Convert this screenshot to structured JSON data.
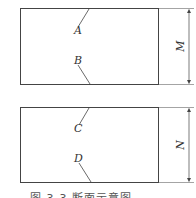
{
  "diagram": {
    "upper_block": {
      "label_top": "A",
      "label_bottom": "B",
      "dimension_label": "M"
    },
    "lower_block": {
      "label_top": "C",
      "label_bottom": "D",
      "dimension_label": "N"
    },
    "caption": "图 3-3   断面示意图",
    "colors": {
      "line": "#444444",
      "text": "#333333",
      "background": "#ffffff"
    }
  }
}
